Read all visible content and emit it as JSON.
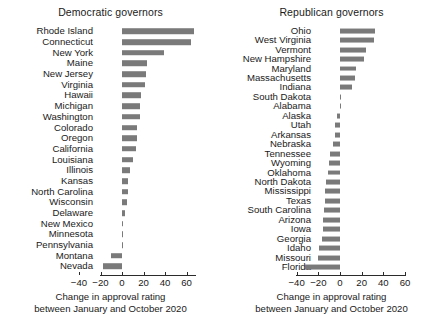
{
  "figure": {
    "background": "#ffffff",
    "bar_color": "#7a7a7a",
    "axis_color": "#2b2b2b"
  },
  "chart_data": [
    {
      "type": "bar",
      "orientation": "horizontal",
      "title": "Democratic governors",
      "xlabel_line1": "Change in approval rating",
      "xlabel_line2": "between January and October 2020",
      "ylabel": "",
      "xlim": [
        -48,
        70
      ],
      "xticks": [
        -40,
        -20,
        0,
        20,
        40,
        60
      ],
      "xticklabels": [
        "−40",
        "−20",
        "0",
        "20",
        "40",
        "60"
      ],
      "grid": false,
      "legend": "none",
      "categories": [
        "Rhode Island",
        "Connecticut",
        "New York",
        "Maine",
        "New Jersey",
        "Virginia",
        "Hawaii",
        "Michigan",
        "Washington",
        "Colorado",
        "Oregon",
        "California",
        "Louisiana",
        "Illinois",
        "Kansas",
        "North Carolina",
        "Wisconsin",
        "Delaware",
        "New Mexico",
        "Minnesota",
        "Pennsylvania",
        "Montana",
        "Nevada"
      ],
      "values": [
        67,
        64,
        39,
        23,
        22,
        21,
        18,
        17,
        17,
        14,
        14,
        13,
        10,
        7,
        6,
        6,
        5,
        3,
        1,
        1,
        1,
        -10,
        -18
      ]
    },
    {
      "type": "bar",
      "orientation": "horizontal",
      "title": "Republican governors",
      "xlabel_line1": "Change in approval rating",
      "xlabel_line2": "between January and October 2020",
      "ylabel": "",
      "xlim": [
        -48,
        70
      ],
      "xticks": [
        -40,
        -20,
        0,
        20,
        40,
        60
      ],
      "xticklabels": [
        "−40",
        "−20",
        "0",
        "20",
        "40",
        "60"
      ],
      "grid": false,
      "legend": "none",
      "categories": [
        "Ohio",
        "West Virginia",
        "Vermont",
        "New Hampshire",
        "Maryland",
        "Massachusetts",
        "Indiana",
        "South Dakota",
        "Alabama",
        "Alaska",
        "Utah",
        "Arkansas",
        "Nebraska",
        "Tennessee",
        "Wyoming",
        "Oklahoma",
        "North Dakota",
        "Mississippi",
        "Texas",
        "South Carolina",
        "Arizona",
        "Iowa",
        "Georgia",
        "Idaho",
        "Missouri",
        "Florida"
      ],
      "values": [
        32,
        31,
        24,
        22,
        15,
        14,
        11,
        1,
        1,
        -3,
        -5,
        -5,
        -6,
        -9,
        -10,
        -11,
        -13,
        -14,
        -14,
        -15,
        -16,
        -16,
        -17,
        -19,
        -20,
        -32
      ]
    }
  ]
}
